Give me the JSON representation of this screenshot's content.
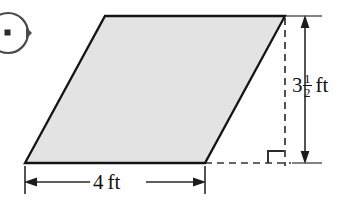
{
  "figure": {
    "kind": "parallelogram-with-dimensions",
    "shape": {
      "name": "parallelogram",
      "fill_color": "#e3e3e3",
      "stroke_color": "#141414",
      "vertices": [
        {
          "x": 25,
          "y": 163
        },
        {
          "x": 105,
          "y": 16
        },
        {
          "x": 285,
          "y": 16
        },
        {
          "x": 205,
          "y": 163
        }
      ]
    },
    "height_dimension": {
      "label_whole": "3",
      "label_numerator": "1",
      "label_denominator": "2",
      "label_unit": "ft",
      "value": 3.5,
      "unit": "ft",
      "orientation": "vertical",
      "line_x": 305,
      "top_y": 16,
      "bottom_y": 163
    },
    "width_dimension": {
      "label_value": "4",
      "label_unit": "ft",
      "value": 4,
      "unit": "ft",
      "orientation": "horizontal",
      "line_y": 182,
      "left_x": 25,
      "right_x": 205
    },
    "right_angle_marker": {
      "present": true,
      "corner_x": 285,
      "corner_y": 163,
      "size": 12
    },
    "guide_lines": {
      "style": "dashed",
      "color": "#33333a",
      "vertical_x": 285,
      "horizontal_y": 163
    },
    "corner_glyph": {
      "name": "clipped-circle-marker",
      "cx": 8,
      "cy": 33,
      "r": 20
    }
  }
}
